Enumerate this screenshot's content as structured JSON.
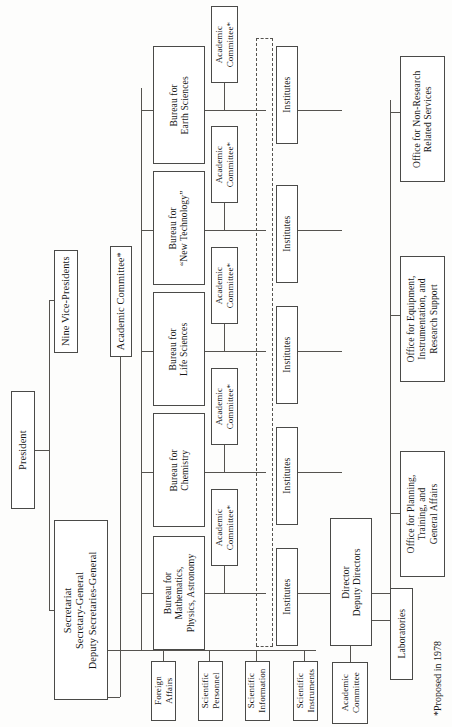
{
  "chart": {
    "orientation": "rotated-90-counterclockwise",
    "line_color": "#55534f",
    "box_border_color": "#4a4a48",
    "background_color": "#fdfdfc",
    "text_color": "#181818"
  },
  "nodes": {
    "president": "President",
    "nine_vice_presidents": "Nine Vice-Presidents",
    "academic_committee_top": "Academic Committee*",
    "secretariat": "Secretariat\nSecretary-General\nDeputy Secretaries-General",
    "secretariat_line1": "Secretariat",
    "secretariat_line2": "Secretary-General",
    "secretariat_line3": "Deputy Secretaries-General",
    "director": "Director\nDeputy Directors",
    "director_line1": "Director",
    "director_line2": "Deputy Directors",
    "academic_committee_institute_line1": "Academic",
    "academic_committee_institute_line2": "Committee",
    "laboratories": "Laboratories"
  },
  "bureaus": [
    {
      "line1": "Bureau for",
      "line2": "Mathematics,",
      "line3": "Physics, Astronomy"
    },
    {
      "line1": "Bureau for",
      "line2": "Chemistry",
      "line3": ""
    },
    {
      "line1": "Bureau for",
      "line2": "Life Sciences",
      "line3": ""
    },
    {
      "line1": "Bureau for",
      "line2": "“New Technology”",
      "line3": ""
    },
    {
      "line1": "Bureau for",
      "line2": "Earth Sciences",
      "line3": ""
    }
  ],
  "academic_committees": [
    {
      "line1": "Academic",
      "line2": "Committee*"
    },
    {
      "line1": "Academic",
      "line2": "Committee*"
    },
    {
      "line1": "Academic",
      "line2": "Committee*"
    },
    {
      "line1": "Academic",
      "line2": "Committee*"
    },
    {
      "line1": "Academic",
      "line2": "Committee*"
    }
  ],
  "institutes": [
    {
      "label": "Institutes"
    },
    {
      "label": "Institutes"
    },
    {
      "label": "Institutes"
    },
    {
      "label": "Institutes"
    },
    {
      "label": "Institutes"
    }
  ],
  "secretariat_departments": [
    {
      "line1": "Foreign",
      "line2": "Affairs"
    },
    {
      "line1": "Scientific",
      "line2": "Personnel"
    },
    {
      "line1": "Scientific",
      "line2": "Information"
    },
    {
      "line1": "Scientific",
      "line2": "Instruments"
    }
  ],
  "offices": [
    {
      "line1": "Office for Planning,",
      "line2": "Training, and",
      "line3": "General Affairs"
    },
    {
      "line1": "Office for Equipment,",
      "line2": "Instrumentation, and",
      "line3": "Research Support"
    },
    {
      "line1": "Office for Non-Research",
      "line2": "Related Services",
      "line3": ""
    }
  ],
  "footnote": "*Proposed in 1978"
}
